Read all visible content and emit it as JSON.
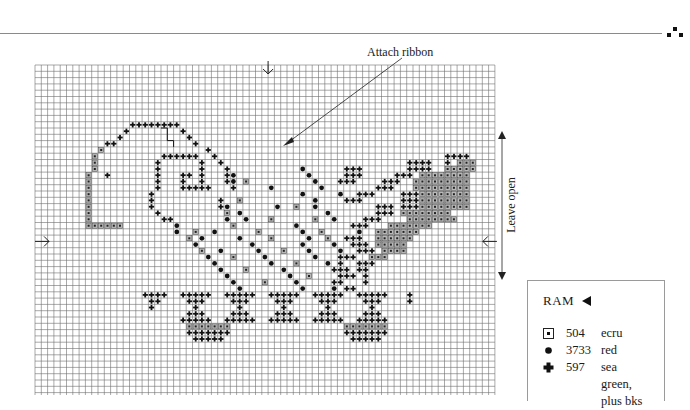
{
  "annotations": {
    "attach_ribbon": "Attach ribbon",
    "leave_open": "Leave open"
  },
  "key": {
    "title": "RAM",
    "items": [
      {
        "symbol": "dotted-square",
        "number": "504",
        "color_lines": [
          "ecru"
        ]
      },
      {
        "symbol": "filled-dot",
        "number": "3733",
        "color_lines": [
          "red"
        ]
      },
      {
        "symbol": "cross-plus",
        "number": "597",
        "color_lines": [
          "sea",
          "green,",
          "plus bks"
        ]
      }
    ]
  },
  "chart_data": {
    "type": "table",
    "grid": {
      "origin_x": 35,
      "origin_y": 65,
      "cell": 6.3,
      "cols": 73,
      "rows": 53
    },
    "legend": {
      "o": "504 ecru",
      "r": "3733 red",
      "g": "597 sea green"
    },
    "markers": {
      "top_arrow_col": 37,
      "side_arrow_row": 28
    },
    "rows": [
      "",
      "",
      "",
      "",
      "",
      "",
      "",
      "",
      "",
      "...............gggggggg",
      "..............g........g",
      ".............g..........g",
      "...........gg............g",
      "..........o................g",
      ".........o..........gggggg..g....................................gggg",
      ".........o.........g......g..g.............................gggg..g.ooo",
      ".........o.........g......g...g...........r......ggg.......gggg..ooooo",
      "........o..g.......g...gg.g...gr...........r.....ggg.....ggg.oooooooo",
      "........o..........g...g..g...gr.o..........r...ggg....ggg..ooooooooo",
      "........o..........g...ggggg...g.....r.......r........ggg...ooooooooo",
      "........o.........g.......................r.....r..ggg....gggoooooooo",
      "........o.........g..........g..o...........r....ggg......gggoooooooo",
      "........o.........g..........gr.......r..o..r.........ggg.gggoooooooo",
      "........o..........g..........o.r.............r.......ggg.oooooooo",
      "........o...........gg........r..r...o......o..r....ggg....oooooooo",
      "........oooooo........r........o.........r........ggg...ooooooo",
      "......................r..o..r......o......r..o.....r..ooooooo",
      "........................o.r.....r....o.....r..o..ggg..oooooo",
      ".........................r........r.......r....r..ggg.ooooo",
      "..........................o..r.....r...o...r....r..ggg.oooo",
      "...........................r...o....r.......r...ggg..ooo",
      "............................r........r...o....r.g..ggg",
      ".............................r...o.....r.......ggg.gg",
      "..............................r.........r..o....ggg.g",
      "...............................r....o....r.....gg...g",
      "................................r.........r....r.gg",
      ".................gggg..ggggg..ggggg..ggggg..ggggg..ggggg...g",
      "..................gg....ggg....ggg....ggg....ggg....ggg....g",
      "..................g......g......g......g......g......g",
      "........................ggg....ggg....ggg....ggg....ggg",
      ".......................ggggg..ggggg..ggggg..ggggg..ggggg",
      "........................ooooooo..................ooooooo",
      "........................ggggggg..................ggggggg",
      ".........................ggggg....................ggggg"
    ]
  }
}
